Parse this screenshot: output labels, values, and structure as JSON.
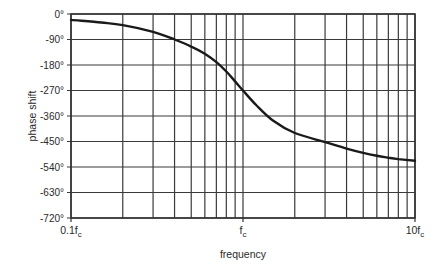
{
  "chart_data": {
    "type": "line",
    "title": "",
    "xlabel": "frequency",
    "ylabel": "phase shift",
    "x_scale": "log",
    "x_range": [
      0.1,
      10
    ],
    "ylim": [
      -720,
      0
    ],
    "grid": true,
    "legend": null,
    "x_tick_labels": [
      {
        "value": 0.1,
        "label": "0.1f",
        "sub": "c"
      },
      {
        "value": 1,
        "label": "f",
        "sub": "c"
      },
      {
        "value": 10,
        "label": "10f",
        "sub": "c"
      }
    ],
    "y_ticks": [
      0,
      -90,
      -180,
      -270,
      -360,
      -450,
      -540,
      -630,
      -720
    ],
    "y_tick_labels": [
      "0°",
      "-90°",
      "-180°",
      "-270°",
      "-360°",
      "-450°",
      "-540°",
      "-630°",
      "-720°"
    ],
    "x_minor_grid": [
      0.1,
      0.2,
      0.3,
      0.4,
      0.5,
      0.6,
      0.7,
      0.8,
      0.9,
      1,
      2,
      3,
      4,
      5,
      6,
      7,
      8,
      9,
      10
    ],
    "series": [
      {
        "name": "phase response",
        "x": [
          0.1,
          0.15,
          0.2,
          0.3,
          0.4,
          0.5,
          0.6,
          0.7,
          0.8,
          0.9,
          1.0,
          1.2,
          1.5,
          2,
          3,
          4,
          5,
          6,
          7,
          8,
          10
        ],
        "values": [
          -21,
          -30,
          -39,
          -63,
          -90,
          -115,
          -140,
          -170,
          -203,
          -238,
          -270,
          -323,
          -377,
          -420,
          -452,
          -475,
          -490,
          -500,
          -507,
          -512,
          -518
        ]
      }
    ]
  }
}
